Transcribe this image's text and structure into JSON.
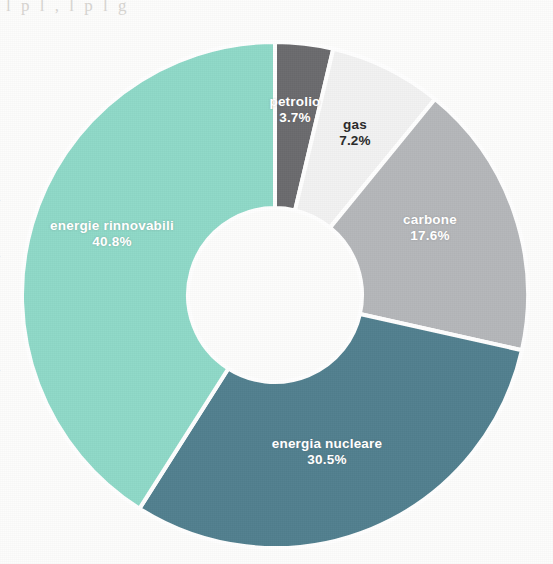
{
  "chart_data": {
    "type": "pie",
    "variant": "donut",
    "title": "",
    "subtitle": "",
    "xlabel": "",
    "ylabel": "",
    "legend": "none",
    "grid": false,
    "labels_inside_slices": true,
    "start_angle_deg": 0,
    "direction": "clockwise",
    "categories": [
      "petrolio",
      "gas",
      "carbone",
      "energia nucleare",
      "energie rinnovabili"
    ],
    "values": [
      3.7,
      7.2,
      17.6,
      30.5,
      40.8
    ],
    "value_unit": "%",
    "slices": [
      {
        "name": "petrolio",
        "value": 3.7,
        "value_label": "3.7%",
        "color": "#6b6b6e",
        "label_color": "light",
        "start_deg": 0.0,
        "end_deg": 13.32,
        "label_x": 295,
        "label_y": 110
      },
      {
        "name": "gas",
        "value": 7.2,
        "value_label": "7.2%",
        "color": "#f2f2f2",
        "label_color": "dark",
        "start_deg": 13.32,
        "end_deg": 39.24,
        "label_x": 355,
        "label_y": 133
      },
      {
        "name": "carbone",
        "value": 17.6,
        "value_label": "17.6%",
        "color": "#b5b7ba",
        "label_color": "light",
        "start_deg": 39.24,
        "end_deg": 102.6,
        "label_x": 430,
        "label_y": 228
      },
      {
        "name": "energia nucleare",
        "value": 30.5,
        "value_label": "30.5%",
        "color": "#52808f",
        "label_color": "light",
        "start_deg": 102.6,
        "end_deg": 212.4,
        "label_x": 327,
        "label_y": 452
      },
      {
        "name": "energie rinnovabili",
        "value": 40.8,
        "value_label": "40.8%",
        "color": "#8fd9c8",
        "label_color": "light",
        "start_deg": 212.4,
        "end_deg": 360.0,
        "label_x": 112,
        "label_y": 234
      }
    ],
    "geometry": {
      "center_x": 275,
      "center_y": 295,
      "outer_radius": 253,
      "inner_radius": 87,
      "gap_color": "#ffffff",
      "gap_width_px": 4
    },
    "background_color": "#fdfdfc"
  },
  "scan": {
    "top_bleed_text": "l p                 l        , l p              l               g",
    "left_marks": [
      "-",
      "-",
      "-",
      "."
    ]
  }
}
